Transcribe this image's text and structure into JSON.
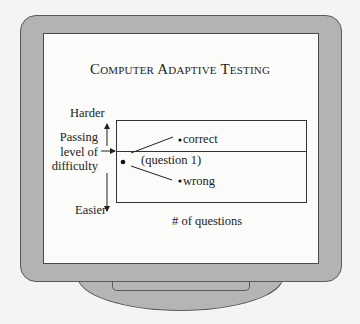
{
  "diagram": {
    "title": "Computer Adaptive Testing",
    "y_axis": {
      "top_label": "Harder",
      "bottom_label": "Easier",
      "passing_label_lines": [
        "Passing",
        "level of",
        "difficulty"
      ]
    },
    "x_axis_label": "# of questions",
    "points": {
      "start_label": "(question 1)",
      "correct_label": "correct",
      "wrong_label": "wrong"
    }
  },
  "colors": {
    "background": "#f4f4f2",
    "bezel": "#b3b3b3",
    "screen": "#fbfbf9",
    "ink": "#222222"
  }
}
